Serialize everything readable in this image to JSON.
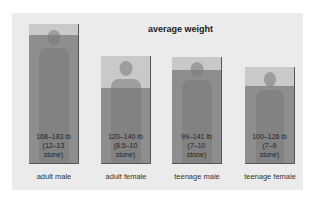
{
  "title": "average weight",
  "colors": {
    "panel": "#ebebeb",
    "box_light": "#c9c9c9",
    "box_fill": "#8e8e8e",
    "border": "#555555"
  },
  "groups": [
    {
      "label": "adult male",
      "range_lb": "168–183 lb",
      "range_stone_1": "(12–13",
      "range_stone_2": "stone)"
    },
    {
      "label": "adult female",
      "range_lb": "120–140 lb",
      "range_stone_1": "(8.5–10",
      "range_stone_2": "stone)"
    },
    {
      "label": "teenage male",
      "range_lb": "99–141 lb",
      "range_stone_1": "(7–10",
      "range_stone_2": "stone)"
    },
    {
      "label": "teenage female",
      "range_lb": "100–126 lb",
      "range_stone_1": "(7–9",
      "range_stone_2": "stone)"
    }
  ]
}
